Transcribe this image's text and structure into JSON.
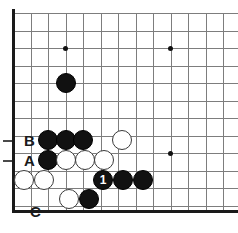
{
  "diagram": {
    "kind": "go-board-problem",
    "board_size": 19,
    "view": {
      "cols": 13,
      "rows": 12
    },
    "geometry": {
      "origin_x": 13,
      "origin_y": 13,
      "spacing": 17.5,
      "stone_diameter": 20,
      "left_edge_x": 13,
      "bottom_edge_y": 211
    },
    "colors": {
      "background": "#ffffff",
      "grid_line": "#7d7d7d",
      "board_edge": "#1a1a1a",
      "black_stone": "#111111",
      "white_stone": "#ffffff",
      "white_stone_outline": "#3a3a3a",
      "label_text": "#1a1a1a",
      "move_number_text": "#ffffff"
    },
    "grid": {
      "vertical_lines_x": [
        13,
        30.5,
        48,
        65.5,
        83,
        100.5,
        118,
        135.5,
        153,
        170.5,
        188,
        205.5,
        223
      ],
      "horizontal_lines_y": [
        13,
        30.5,
        48,
        65.5,
        83,
        100.5,
        118,
        135.5,
        153,
        170.5,
        188,
        205.5
      ]
    },
    "star_points": [
      {
        "name": "star-point-top-left",
        "x": 65.5,
        "y": 48
      },
      {
        "name": "star-point-top-right",
        "x": 170.5,
        "y": 48
      },
      {
        "name": "star-point-right",
        "x": 170.5,
        "y": 153
      }
    ],
    "point_labels": [
      {
        "text": "B",
        "x": 24,
        "y": 133,
        "tick_y": 140,
        "name": "point-label-b"
      },
      {
        "text": "A",
        "x": 24,
        "y": 153,
        "tick_y": 160,
        "name": "point-label-a"
      },
      {
        "text": "C",
        "x": 30,
        "y": 204,
        "tick_y": null,
        "name": "point-label-c"
      }
    ],
    "stones": [
      {
        "color": "black",
        "x": 65.5,
        "y": 83,
        "label": "",
        "name": "black-stone-approach"
      },
      {
        "color": "black",
        "x": 48,
        "y": 140,
        "label": "",
        "name": "black-stone-b-row-1"
      },
      {
        "color": "black",
        "x": 65.5,
        "y": 140,
        "label": "",
        "name": "black-stone-b-row-2"
      },
      {
        "color": "black",
        "x": 83,
        "y": 140,
        "label": "",
        "name": "black-stone-b-row-3"
      },
      {
        "color": "white",
        "x": 122,
        "y": 140,
        "label": "",
        "name": "white-stone-b-row-right"
      },
      {
        "color": "black",
        "x": 48,
        "y": 160,
        "label": "",
        "name": "black-stone-a-row-1"
      },
      {
        "color": "white",
        "x": 66,
        "y": 160,
        "label": "",
        "name": "white-stone-a-row-1"
      },
      {
        "color": "white",
        "x": 85,
        "y": 160,
        "label": "",
        "name": "white-stone-a-row-2"
      },
      {
        "color": "white",
        "x": 104,
        "y": 160,
        "label": "",
        "name": "white-stone-a-row-3"
      },
      {
        "color": "white",
        "x": 24,
        "y": 180,
        "label": "",
        "name": "white-stone-left-1"
      },
      {
        "color": "white",
        "x": 44,
        "y": 180,
        "label": "",
        "name": "white-stone-left-2"
      },
      {
        "color": "black",
        "x": 103,
        "y": 180,
        "label": "1",
        "name": "black-stone-move-1"
      },
      {
        "color": "black",
        "x": 123,
        "y": 180,
        "label": "",
        "name": "black-stone-row-3-2"
      },
      {
        "color": "black",
        "x": 143,
        "y": 180,
        "label": "",
        "name": "black-stone-row-3-3"
      },
      {
        "color": "white",
        "x": 69,
        "y": 199,
        "label": "",
        "name": "white-stone-bottom-1"
      },
      {
        "color": "black",
        "x": 89,
        "y": 199,
        "label": "",
        "name": "black-stone-bottom-1"
      }
    ],
    "moves": [
      {
        "number": "1",
        "color": "black"
      }
    ]
  }
}
